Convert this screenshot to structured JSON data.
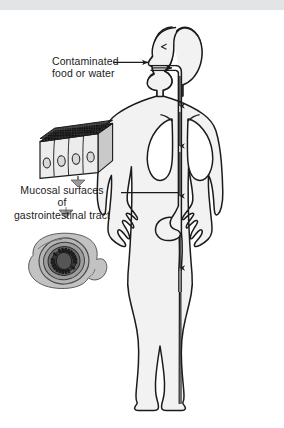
{
  "figure": {
    "name": "transmission-route-diagram",
    "background_color": "#ffffff",
    "top_band_color": "#e3e4e6",
    "ink_color": "#1b1b1b",
    "body_fill": "#f2f2f2",
    "organ_fill": "#ffffff",
    "tissue_gray": "#bdbdbd",
    "dark_gray": "#4a4a4a",
    "microvilli_color": "#242424"
  },
  "labels": {
    "contaminated": {
      "line1": "Contaminated",
      "line2": "food or water"
    },
    "mucosal": {
      "line1": "Mucosal surfaces",
      "line2": "of",
      "line3": "gastrointestinal tract"
    }
  },
  "graphics": {
    "human_figure": "human-body-outline-front-view",
    "epithelium_block": "columnar-epithelium-block",
    "intestine_section": "intestine-cross-section",
    "tract": "gastrointestinal-tract-path",
    "flow_arrows": "ingestion-flow-arrows"
  }
}
